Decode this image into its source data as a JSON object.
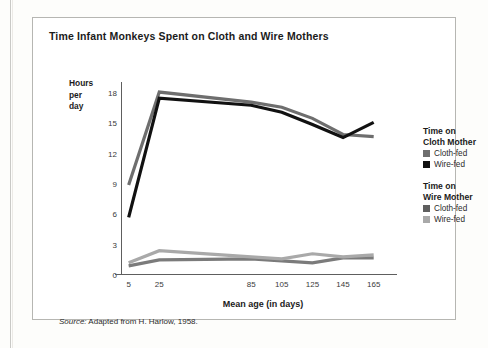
{
  "chart_data": {
    "type": "line",
    "title": "Time Infant Monkeys Spent on Cloth and Wire Mothers",
    "xlabel": "Mean age (in days)",
    "ylabel": "Hours per day",
    "ylabel_lines": [
      "Hours",
      "per",
      "day"
    ],
    "x": [
      5,
      25,
      85,
      105,
      125,
      145,
      165
    ],
    "xtick_labels": [
      "5",
      "25",
      "85",
      "105",
      "125",
      "145",
      "165"
    ],
    "ytick_labels": [
      "0",
      "3",
      "6",
      "9",
      "12",
      "15",
      "18"
    ],
    "yticks": [
      0,
      3,
      6,
      9,
      12,
      15,
      18
    ],
    "ylim": [
      0,
      19
    ],
    "xlim": [
      0,
      175
    ],
    "grid": false,
    "legend_position": "right",
    "series": [
      {
        "name": "Time on Cloth Mother - Cloth-fed",
        "group": "Time on Cloth Mother",
        "label": "Cloth-fed",
        "color": "#6e6e6e",
        "values": [
          9.0,
          18.2,
          17.2,
          16.7,
          15.6,
          14.0,
          13.8
        ]
      },
      {
        "name": "Time on Cloth Mother - Wire-fed",
        "group": "Time on Cloth Mother",
        "label": "Wire-fed",
        "color": "#111111",
        "values": [
          5.8,
          17.6,
          16.9,
          16.2,
          15.0,
          13.7,
          15.2
        ]
      },
      {
        "name": "Time on Wire Mother - Cloth-fed",
        "group": "Time on Wire Mother",
        "label": "Cloth-fed",
        "color": "#7b7b7b",
        "values": [
          1.0,
          1.6,
          1.7,
          1.5,
          1.3,
          1.8,
          1.8
        ]
      },
      {
        "name": "Time on Wire Mother - Wire-fed",
        "group": "Time on Wire Mother",
        "label": "Wire-fed",
        "color": "#a9a9a9",
        "values": [
          1.3,
          2.5,
          1.9,
          1.7,
          2.2,
          1.9,
          2.1
        ]
      }
    ]
  },
  "legend": {
    "groups": [
      {
        "title_lines": [
          "Time on",
          "Cloth Mother"
        ],
        "items": [
          {
            "label": "Cloth-fed",
            "color": "#6e6e6e"
          },
          {
            "label": "Wire-fed",
            "color": "#111111"
          }
        ]
      },
      {
        "title_lines": [
          "Time on",
          "Wire Mother"
        ],
        "items": [
          {
            "label": "Cloth-fed",
            "color": "#5f5f5f"
          },
          {
            "label": "Wire-fed",
            "color": "#a9a9a9"
          }
        ]
      }
    ]
  },
  "source": {
    "prefix": "Source:",
    "text": "Adapted from H. Harlow, 1958."
  }
}
